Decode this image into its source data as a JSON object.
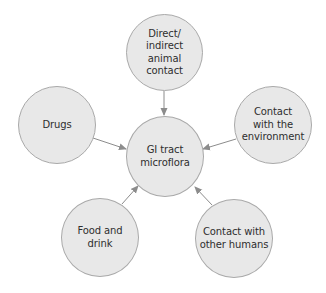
{
  "diagram": {
    "type": "hub-and-spoke",
    "colors": {
      "node_fill": "#e8e8e8",
      "node_border": "#a9a9a9",
      "arrow": "#8c8c8c",
      "text": "#2e2e2e",
      "background": "#ffffff"
    },
    "center": {
      "id": "gi-tract",
      "label": "GI tract\nmicroflora"
    },
    "nodes": [
      {
        "id": "animal-contact",
        "label": "Direct/\nindirect\nanimal\ncontact"
      },
      {
        "id": "drugs",
        "label": "Drugs"
      },
      {
        "id": "environment",
        "label": "Contact\nwith the\nenvironment"
      },
      {
        "id": "food-drink",
        "label": "Food and\ndrink"
      },
      {
        "id": "other-humans",
        "label": "Contact with\nother humans"
      }
    ],
    "edges": [
      {
        "from": "animal-contact",
        "to": "gi-tract"
      },
      {
        "from": "drugs",
        "to": "gi-tract"
      },
      {
        "from": "environment",
        "to": "gi-tract"
      },
      {
        "from": "food-drink",
        "to": "gi-tract"
      },
      {
        "from": "other-humans",
        "to": "gi-tract"
      }
    ]
  }
}
